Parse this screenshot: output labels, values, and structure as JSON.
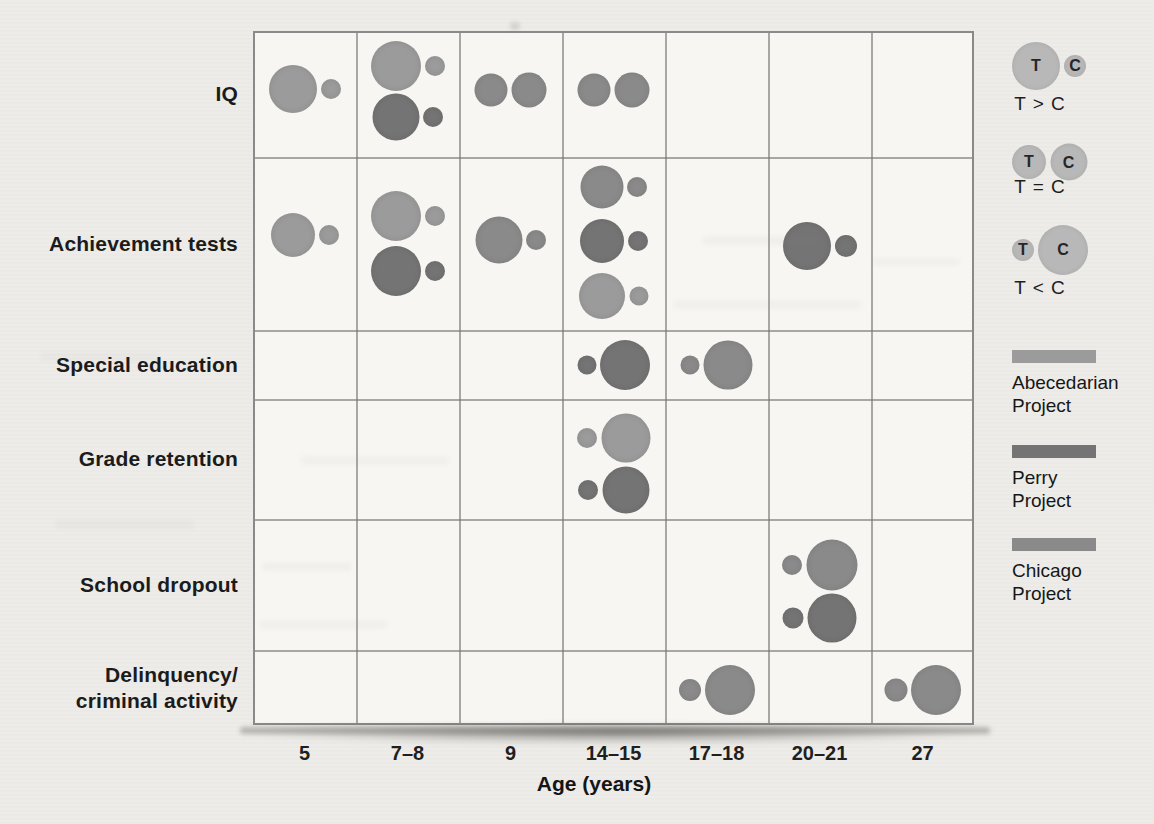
{
  "chart_data": {
    "type": "bubble-pair-matrix",
    "title": "",
    "xlabel": "Age (years)",
    "x_categories": [
      "5",
      "7–8",
      "9",
      "14–15",
      "17–18",
      "20–21",
      "27"
    ],
    "y_categories": [
      "IQ",
      "Achievement tests",
      "Special education",
      "Grade retention",
      "School dropout",
      "Delinquency/criminal activity"
    ],
    "row_label_lines": [
      [
        "IQ"
      ],
      [
        "Achievement tests"
      ],
      [
        "Special education"
      ],
      [
        "Grade retention"
      ],
      [
        "School dropout"
      ],
      [
        "Delinquency/",
        "criminal activity"
      ]
    ],
    "relation_legend": {
      "circle_fill": "#b8b8b8",
      "t_label": "T",
      "c_label": "C",
      "items": [
        {
          "label": "T > C",
          "t_d": 48,
          "c_d": 22
        },
        {
          "label": "T = C",
          "t_d": 34,
          "c_d": 37
        },
        {
          "label": "T < C",
          "t_d": 22,
          "c_d": 50
        }
      ]
    },
    "projects": [
      {
        "id": "abecedarian",
        "label_lines": [
          "Abecedarian",
          "Project"
        ],
        "color": "#9b9b9b"
      },
      {
        "id": "perry",
        "label_lines": [
          "Perry",
          "Project"
        ],
        "color": "#747474"
      },
      {
        "id": "chicago",
        "label_lines": [
          "Chicago",
          "Project"
        ],
        "color": "#8a8a8a"
      }
    ],
    "points": [
      {
        "row": "IQ",
        "age": "5",
        "relation": "T > C",
        "project": "abecedarian",
        "t_d": 48,
        "c_d": 20,
        "dy": -5
      },
      {
        "row": "IQ",
        "age": "7–8",
        "relation": "T > C",
        "project": "abecedarian",
        "t_d": 50,
        "c_d": 20,
        "dy": -28
      },
      {
        "row": "IQ",
        "age": "7–8",
        "relation": "T > C",
        "project": "perry",
        "t_d": 47,
        "c_d": 20,
        "dy": 23
      },
      {
        "row": "IQ",
        "age": "9",
        "relation": "T = C",
        "project": "chicago",
        "t_d": 33,
        "c_d": 35,
        "dy": -4
      },
      {
        "row": "IQ",
        "age": "14–15",
        "relation": "T = C",
        "project": "chicago",
        "t_d": 33,
        "c_d": 35,
        "dy": -4
      },
      {
        "row": "Achievement tests",
        "age": "5",
        "relation": "T > C",
        "project": "abecedarian",
        "t_d": 44,
        "c_d": 20,
        "dy": -9
      },
      {
        "row": "Achievement tests",
        "age": "7–8",
        "relation": "T > C",
        "project": "abecedarian",
        "t_d": 50,
        "c_d": 20,
        "dy": -28
      },
      {
        "row": "Achievement tests",
        "age": "7–8",
        "relation": "T > C",
        "project": "perry",
        "t_d": 50,
        "c_d": 20,
        "dy": 27
      },
      {
        "row": "Achievement tests",
        "age": "9",
        "relation": "T > C",
        "project": "chicago",
        "t_d": 47,
        "c_d": 20,
        "dy": -4
      },
      {
        "row": "Achievement tests",
        "age": "14–15",
        "relation": "T > C",
        "project": "chicago",
        "t_d": 43,
        "c_d": 20,
        "dy": -57
      },
      {
        "row": "Achievement tests",
        "age": "14–15",
        "relation": "T > C",
        "project": "perry",
        "t_d": 44,
        "c_d": 20,
        "dy": -3
      },
      {
        "row": "Achievement tests",
        "age": "14–15",
        "relation": "T > C",
        "project": "abecedarian",
        "t_d": 46,
        "c_d": 19,
        "dy": 52
      },
      {
        "row": "Achievement tests",
        "age": "20–21",
        "relation": "T > C",
        "project": "perry",
        "t_d": 48,
        "c_d": 22,
        "dy": 2
      },
      {
        "row": "Special education",
        "age": "14–15",
        "relation": "T < C",
        "project": "perry",
        "t_d": 19,
        "c_d": 50,
        "dy": 0
      },
      {
        "row": "Special education",
        "age": "17–18",
        "relation": "T < C",
        "project": "chicago",
        "t_d": 19,
        "c_d": 49,
        "dy": 0
      },
      {
        "row": "Grade retention",
        "age": "14–15",
        "relation": "T < C",
        "project": "abecedarian",
        "t_d": 20,
        "c_d": 49,
        "dy": -21
      },
      {
        "row": "Grade retention",
        "age": "14–15",
        "relation": "T < C",
        "project": "perry",
        "t_d": 20,
        "c_d": 47,
        "dy": 31
      },
      {
        "row": "School dropout",
        "age": "20–21",
        "relation": "T < C",
        "project": "chicago",
        "t_d": 20,
        "c_d": 51,
        "dy": -20
      },
      {
        "row": "School dropout",
        "age": "20–21",
        "relation": "T < C",
        "project": "perry",
        "t_d": 21,
        "c_d": 49,
        "dy": 33
      },
      {
        "row": "Delinquency/criminal activity",
        "age": "17–18",
        "relation": "T < C",
        "project": "chicago",
        "t_d": 22,
        "c_d": 50,
        "dy": 2
      },
      {
        "row": "Delinquency/criminal activity",
        "age": "27",
        "relation": "T < C",
        "project": "perry",
        "color": "#8a8a8a",
        "t_d": 23,
        "c_d": 50,
        "dy": 2
      }
    ]
  }
}
